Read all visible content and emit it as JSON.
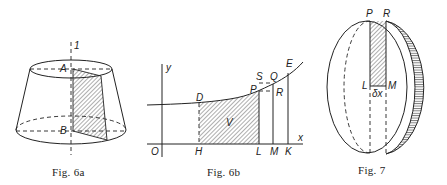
{
  "figures": [
    {
      "id": "fig6a",
      "caption": "Fig. 6a",
      "labels": {
        "axis": "1",
        "top_point": "A",
        "bottom_point": "B"
      }
    },
    {
      "id": "fig6b",
      "caption": "Fig. 6b",
      "labels": {
        "y_axis": "y",
        "x_axis": "x",
        "origin": "O",
        "D": "D",
        "P": "P",
        "S": "S",
        "Q": "Q",
        "R": "R",
        "E": "E",
        "H": "H",
        "L": "L",
        "M": "M",
        "K": "K",
        "V": "V"
      }
    },
    {
      "id": "fig7",
      "caption": "Fig. 7",
      "labels": {
        "P": "P",
        "R": "R",
        "L": "L",
        "M": "M",
        "dx": "δx"
      }
    }
  ],
  "colors": {
    "ink": "#222222",
    "background": "#ffffff"
  }
}
